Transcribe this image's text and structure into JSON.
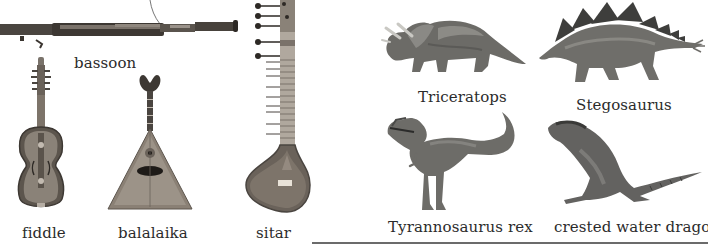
{
  "instruments": {
    "bassoon": {
      "label": "bassoon",
      "icon": "bassoon-icon"
    },
    "fiddle": {
      "label": "fiddle",
      "icon": "fiddle-icon"
    },
    "balalaika": {
      "label": "balalaika",
      "icon": "balalaika-icon"
    },
    "sitar": {
      "label": "sitar",
      "icon": "sitar-icon"
    }
  },
  "animals": {
    "triceratops": {
      "label": "Triceratops",
      "icon": "triceratops-icon"
    },
    "stegosaurus": {
      "label": "Stegosaurus",
      "icon": "stegosaurus-icon"
    },
    "tyrannosaurus": {
      "label": "Tyrannosaurus rex",
      "icon": "tyrannosaurus-icon"
    },
    "water_dragon": {
      "label": "crested water dragon",
      "icon": "water-dragon-icon"
    }
  },
  "colors": {
    "wood_dark": "#3a3530",
    "wood_mid": "#6e665e",
    "wood_light": "#a39a90",
    "skin_dark": "#4a4a48",
    "skin_mid": "#7b7a76",
    "skin_light": "#b0afab",
    "rule": "#6b6b6b"
  }
}
